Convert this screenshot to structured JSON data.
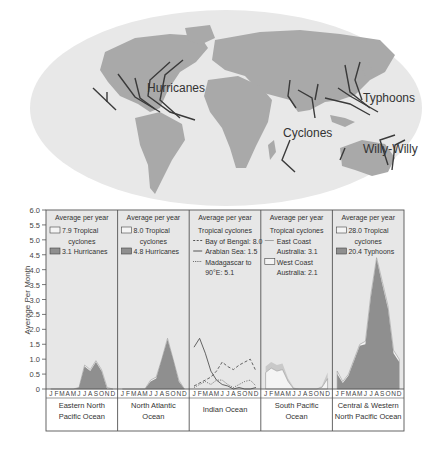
{
  "map": {
    "labels": [
      {
        "text": "Hurricanes",
        "x": 147,
        "y": 92
      },
      {
        "text": "Typhoons",
        "x": 363,
        "y": 102
      },
      {
        "text": "Cyclones",
        "x": 283,
        "y": 137
      },
      {
        "text": "Willy-Willy",
        "x": 363,
        "y": 153
      }
    ]
  },
  "chart_data": {
    "type": "area",
    "title": "",
    "ylabel": "Average Per Month",
    "ylim": [
      0,
      6.0
    ],
    "yticks": [
      "0",
      "0.5",
      "1.0",
      "1.5",
      "2.0",
      "2.5",
      "3.0",
      "3.5",
      "4.0",
      "4.5",
      "5.0",
      "5.5",
      "6.0"
    ],
    "months": [
      "J",
      "F",
      "M",
      "A",
      "M",
      "J",
      "J",
      "A",
      "S",
      "O",
      "N",
      "D"
    ],
    "panels": [
      {
        "region": [
          "Eastern North",
          "Pacific Ocean"
        ],
        "header": "Average per year",
        "legend": [
          {
            "swatch": "outline",
            "text": [
              "7.9 Tropical",
              "cyclones"
            ]
          },
          {
            "swatch": "filled",
            "text": [
              "3.1 Hurricanes"
            ]
          }
        ],
        "series": [
          {
            "name": "Tropical cyclones",
            "style": "outline",
            "values": [
              0,
              0,
              0,
              0,
              0,
              0.05,
              0.8,
              0.65,
              0.95,
              0.65,
              0.05,
              0
            ]
          },
          {
            "name": "Hurricanes",
            "style": "filled",
            "values": [
              0,
              0,
              0,
              0,
              0,
              0.05,
              0.75,
              0.6,
              0.9,
              0.6,
              0,
              0
            ]
          }
        ]
      },
      {
        "region": [
          "North Atlantic",
          "Ocean"
        ],
        "header": "Average per year",
        "legend": [
          {
            "swatch": "outline",
            "text": [
              "8.0 Tropical",
              "cyclones"
            ]
          },
          {
            "swatch": "filled",
            "text": [
              "4.8 Hurricanes"
            ]
          }
        ],
        "series": [
          {
            "name": "Tropical cyclones",
            "style": "outline",
            "values": [
              0,
              0,
              0,
              0,
              0,
              0.3,
              0.4,
              1.0,
              1.7,
              1.0,
              0.3,
              0
            ]
          },
          {
            "name": "Hurricanes",
            "style": "filled",
            "values": [
              0,
              0,
              0,
              0,
              0,
              0.25,
              0.35,
              1.0,
              1.65,
              1.0,
              0.25,
              0
            ]
          }
        ]
      },
      {
        "region": [
          "Indian Ocean"
        ],
        "header": "Average per year",
        "legend": [
          {
            "swatch": "none",
            "text": [
              "Tropical cyclones"
            ]
          },
          {
            "swatch": "dashed",
            "text": [
              "Bay of Bengal: 8.0"
            ]
          },
          {
            "swatch": "solid",
            "text": [
              "Arabian Sea: 1.5"
            ]
          },
          {
            "swatch": "dotted",
            "text": [
              "Madagascar to",
              "90°E: 5.1"
            ]
          }
        ],
        "series": [
          {
            "name": "Bay of Bengal",
            "style": "dashed",
            "values": [
              0.1,
              0.2,
              0.3,
              0.4,
              0.6,
              0.9,
              0.75,
              0.65,
              0.8,
              0.9,
              1.0,
              0.6
            ]
          },
          {
            "name": "Arabian Sea",
            "style": "solid",
            "values": [
              1.4,
              1.7,
              1.2,
              0.6,
              0.3,
              0.15,
              0.1,
              0,
              0.05,
              0,
              0,
              0.05
            ]
          },
          {
            "name": "Madagascar to 90°E",
            "style": "dotted",
            "values": [
              0.05,
              0.15,
              0.25,
              0.15,
              0.3,
              0.3,
              0.15,
              0.05,
              0.15,
              0.25,
              0.3,
              0.1
            ]
          }
        ]
      },
      {
        "region": [
          "South Pacific",
          "Ocean"
        ],
        "header": "Average per year",
        "legend": [
          {
            "swatch": "none",
            "text": [
              "Tropical cyclones"
            ]
          },
          {
            "swatch": "line",
            "text": [
              "East Coast",
              "Australia: 3.1"
            ]
          },
          {
            "swatch": "outline",
            "text": [
              "West Coast",
              "Australia: 2.1"
            ]
          }
        ],
        "series": [
          {
            "name": "East Coast Australia",
            "style": "filled-light",
            "values": [
              0.75,
              0.9,
              0.8,
              0.85,
              0.35,
              0.05,
              0,
              0,
              0,
              0,
              0.1,
              0.55
            ]
          },
          {
            "name": "West Coast Australia",
            "style": "outline",
            "values": [
              0.55,
              0.7,
              0.6,
              0.65,
              0.25,
              0,
              0,
              0,
              0,
              0,
              0.05,
              0.35
            ]
          }
        ]
      },
      {
        "region": [
          "Central & Western",
          "North Pacific Ocean"
        ],
        "header": "Average per year",
        "legend": [
          {
            "swatch": "outline",
            "text": [
              "28.0 Tropical",
              "cyclones"
            ]
          },
          {
            "swatch": "filled",
            "text": [
              "20.4 Typhoons"
            ]
          }
        ],
        "series": [
          {
            "name": "Tropical cyclones",
            "style": "outline",
            "values": [
              0.6,
              0.25,
              0.5,
              1.0,
              1.5,
              1.6,
              3.2,
              4.4,
              3.6,
              2.8,
              1.3,
              1.0
            ]
          },
          {
            "name": "Typhoons",
            "style": "filled",
            "values": [
              0.5,
              0.2,
              0.45,
              0.95,
              1.45,
              1.5,
              3.1,
              4.35,
              3.5,
              2.7,
              1.2,
              0.9
            ]
          }
        ]
      }
    ]
  },
  "colors": {
    "ocean": "#e8e8e8",
    "land": "#a8a8a8",
    "arrow": "#3a3a3a",
    "fill_dark": "#8f8f8f",
    "fill_light": "#c9c9c9",
    "panel_bg": "#e7e7e7",
    "line": "#555555"
  }
}
